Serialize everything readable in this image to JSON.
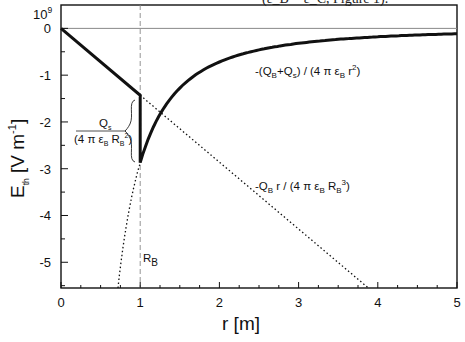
{
  "caption_fragment": "(ε_B = ε_C, Figure 1).",
  "chart_data": {
    "type": "line",
    "title": "",
    "xlabel": "r [m]",
    "ylabel": "E_th  [V m^-1]",
    "y_scale_label": "10^9",
    "xlim": [
      0,
      5
    ],
    "ylim": [
      -5.55,
      0.5
    ],
    "x_ticks": [
      0,
      1,
      2,
      3,
      4,
      5
    ],
    "x_tick_labels": [
      "0",
      "1",
      "2",
      "3",
      "4",
      "5"
    ],
    "x_minor_step": 0.25,
    "y_ticks": [
      0,
      -1,
      -2,
      -3,
      -4,
      -5
    ],
    "y_tick_labels": [
      "0",
      "-1",
      "-2",
      "-3",
      "-4",
      "-5"
    ],
    "y_minor_step": 0.5,
    "grid": false,
    "R_B": 1.0,
    "R_B_label": "R_B",
    "series": [
      {
        "name": "E_th (total)",
        "style": "solid-thick",
        "inner_slope": -1.43,
        "outer_coeff": -2.87,
        "description": "linear for r<R_B, then jump, then 1/r^2"
      },
      {
        "name": "-Q_B r / (4 π ε_B R_B^3)",
        "style": "dotted",
        "slope": -1.43
      },
      {
        "name": "-(Q_B+Q_s) / (4 π ε_B r^2)",
        "style": "dotted-inner",
        "coeff": -2.87
      }
    ],
    "reference_lines": [
      {
        "name": "zero-line",
        "y": 0
      },
      {
        "name": "R_B-line",
        "x": 1.0,
        "style": "dashed"
      }
    ],
    "annotations": {
      "outer_field": {
        "parts": [
          "-(Q",
          "B",
          "+Q",
          "s",
          ") / (4 π ε",
          "B",
          " r",
          "2",
          ")"
        ]
      },
      "inner_field": {
        "parts": [
          "-Q",
          "B",
          " r / (4 π ε",
          "B",
          " R",
          "B",
          "3",
          ")"
        ]
      },
      "jump_numerator": {
        "parts": [
          "Q",
          "s"
        ]
      },
      "jump_denominator": {
        "parts": [
          "(4 π ε",
          "B",
          " R",
          "B",
          "2",
          ")"
        ]
      }
    }
  }
}
